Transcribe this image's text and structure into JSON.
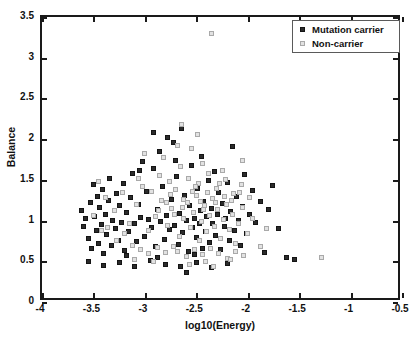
{
  "chart_data": {
    "type": "scatter",
    "title": "",
    "xlabel": "log10(Energy)",
    "ylabel": "Balance",
    "xlim": [
      -4,
      -0.5
    ],
    "ylim": [
      0,
      3.5
    ],
    "xticks": [
      -4,
      -3.5,
      -3,
      -2.5,
      -2,
      -1.5,
      -1,
      -0.5
    ],
    "xticklabels": [
      "-4",
      "-3.5",
      "-3",
      "-2.5",
      "-2",
      "-1.5",
      "-1",
      "-0.5"
    ],
    "yticks": [
      0,
      0.5,
      1,
      1.5,
      2,
      2.5,
      3,
      3.5
    ],
    "yticklabels": [
      "0",
      "0.5",
      "1",
      "1.5",
      "2",
      "2.5",
      "3",
      "3.5"
    ],
    "grid": false,
    "legend_position": "top-right",
    "colors": {
      "carrier": "#2b2b2b",
      "noncarrier": "#e2e2e2",
      "noncarrier_edge": "#a9a9a9",
      "axis": "#1a1a1a"
    },
    "series": [
      {
        "name": "Mutation carrier",
        "marker": "filled-square",
        "color": "#2b2b2b",
        "points": [
          [
            -3.62,
            1.12
          ],
          [
            -3.6,
            0.93
          ],
          [
            -3.58,
            1.02
          ],
          [
            -3.55,
            0.78
          ],
          [
            -3.53,
            1.22
          ],
          [
            -3.52,
            0.66
          ],
          [
            -3.5,
            1.44
          ],
          [
            -3.49,
            1.05
          ],
          [
            -3.47,
            0.88
          ],
          [
            -3.46,
            1.3
          ],
          [
            -3.45,
            0.72
          ],
          [
            -3.44,
            1.16
          ],
          [
            -3.42,
            0.95
          ],
          [
            -3.41,
            1.38
          ],
          [
            -3.4,
            0.6
          ],
          [
            -3.38,
            1.08
          ],
          [
            -3.37,
            0.83
          ],
          [
            -3.35,
            1.25
          ],
          [
            -3.34,
            1.52
          ],
          [
            -3.32,
            0.7
          ],
          [
            -3.31,
            1.0
          ],
          [
            -3.29,
            0.9
          ],
          [
            -3.28,
            1.33
          ],
          [
            -3.26,
            0.75
          ],
          [
            -3.25,
            1.18
          ],
          [
            -3.23,
            0.98
          ],
          [
            -3.21,
            1.46
          ],
          [
            -3.2,
            0.63
          ],
          [
            -3.18,
            1.1
          ],
          [
            -3.16,
            0.86
          ],
          [
            -3.14,
            1.28
          ],
          [
            -3.12,
            1.58
          ],
          [
            -3.1,
            0.96
          ],
          [
            -3.08,
            0.74
          ],
          [
            -3.06,
            1.2
          ],
          [
            -3.04,
            1.04
          ],
          [
            -3.02,
            1.73
          ],
          [
            -3.0,
            0.8
          ],
          [
            -2.98,
            1.36
          ],
          [
            -2.96,
            1.01
          ],
          [
            -2.94,
            0.92
          ],
          [
            -2.92,
            1.64
          ],
          [
            -2.9,
            0.68
          ],
          [
            -2.88,
            1.14
          ],
          [
            -2.86,
            1.85
          ],
          [
            -2.85,
            0.99
          ],
          [
            -2.83,
            1.42
          ],
          [
            -2.81,
            0.77
          ],
          [
            -2.79,
            1.06
          ],
          [
            -2.78,
            2.02
          ],
          [
            -2.76,
            0.89
          ],
          [
            -2.74,
            1.26
          ],
          [
            -2.72,
            1.96
          ],
          [
            -2.71,
            0.94
          ],
          [
            -2.69,
            1.54
          ],
          [
            -2.67,
            0.71
          ],
          [
            -2.66,
            1.09
          ],
          [
            -2.64,
            2.13
          ],
          [
            -2.63,
            0.85
          ],
          [
            -2.61,
            1.31
          ],
          [
            -2.6,
            1.0
          ],
          [
            -2.58,
            0.62
          ],
          [
            -2.57,
            1.18
          ],
          [
            -2.55,
            1.68
          ],
          [
            -2.54,
            0.91
          ],
          [
            -2.52,
            1.03
          ],
          [
            -2.5,
            0.79
          ],
          [
            -2.49,
            1.4
          ],
          [
            -2.47,
            0.97
          ],
          [
            -2.46,
            1.12
          ],
          [
            -2.44,
            0.66
          ],
          [
            -2.43,
            1.23
          ],
          [
            -2.41,
            0.87
          ],
          [
            -2.4,
            1.05
          ],
          [
            -2.38,
            1.49
          ],
          [
            -2.37,
            0.73
          ],
          [
            -2.35,
            1.15
          ],
          [
            -2.34,
            0.96
          ],
          [
            -2.32,
            1.6
          ],
          [
            -2.31,
            0.82
          ],
          [
            -2.29,
            1.07
          ],
          [
            -2.28,
            1.34
          ],
          [
            -2.26,
            0.64
          ],
          [
            -2.25,
            1.21
          ],
          [
            -2.23,
            0.93
          ],
          [
            -2.22,
            1.02
          ],
          [
            -2.2,
            1.47
          ],
          [
            -2.18,
            0.76
          ],
          [
            -2.17,
            1.11
          ],
          [
            -2.15,
            1.91
          ],
          [
            -2.13,
            0.88
          ],
          [
            -2.11,
            1.29
          ],
          [
            -2.09,
            1.0
          ],
          [
            -2.07,
            0.69
          ],
          [
            -2.05,
            1.17
          ],
          [
            -2.03,
            1.56
          ],
          [
            -2.01,
            0.84
          ],
          [
            -1.98,
            1.08
          ],
          [
            -1.95,
            1.37
          ],
          [
            -1.92,
            0.98
          ],
          [
            -1.88,
            1.24
          ],
          [
            -1.84,
            0.61
          ],
          [
            -1.8,
            1.13
          ],
          [
            -1.76,
            1.43
          ],
          [
            -1.7,
            0.9
          ],
          [
            -1.62,
            0.55
          ],
          [
            -1.55,
            0.52
          ],
          [
            -3.55,
            0.5
          ],
          [
            -3.4,
            0.45
          ],
          [
            -3.25,
            0.48
          ],
          [
            -3.1,
            0.44
          ],
          [
            -2.95,
            0.51
          ],
          [
            -2.8,
            0.46
          ],
          [
            -2.65,
            0.43
          ],
          [
            -2.5,
            0.49
          ],
          [
            -2.35,
            0.42
          ],
          [
            -2.2,
            0.47
          ],
          [
            -2.6,
            0.36
          ],
          [
            -2.45,
            1.79
          ],
          [
            -2.92,
            2.08
          ],
          [
            -2.7,
            1.74
          ],
          [
            -3.05,
            1.62
          ],
          [
            -2.88,
            0.55
          ],
          [
            -2.52,
            0.58
          ],
          [
            -3.18,
            0.57
          ]
        ]
      },
      {
        "name": "Non-carrier",
        "marker": "open-square",
        "color": "#e2e2e2",
        "points": [
          [
            -2.35,
            3.3
          ],
          [
            -2.64,
            2.18
          ],
          [
            -3.0,
            1.82
          ],
          [
            -2.82,
            1.78
          ],
          [
            -2.55,
            1.88
          ],
          [
            -3.45,
            1.48
          ],
          [
            -3.38,
            1.28
          ],
          [
            -3.3,
            1.12
          ],
          [
            -3.22,
            1.35
          ],
          [
            -3.15,
            0.97
          ],
          [
            -3.08,
            1.2
          ],
          [
            -3.02,
            1.42
          ],
          [
            -2.96,
            0.88
          ],
          [
            -2.9,
            1.05
          ],
          [
            -2.84,
            1.25
          ],
          [
            -2.78,
            0.94
          ],
          [
            -2.74,
            1.15
          ],
          [
            -2.7,
            1.38
          ],
          [
            -2.66,
            0.8
          ],
          [
            -2.62,
            1.02
          ],
          [
            -2.59,
            1.22
          ],
          [
            -2.56,
            0.91
          ],
          [
            -2.53,
            1.1
          ],
          [
            -2.5,
            1.31
          ],
          [
            -2.47,
            0.75
          ],
          [
            -2.45,
            0.99
          ],
          [
            -2.42,
            1.18
          ],
          [
            -2.4,
            0.86
          ],
          [
            -2.37,
            1.06
          ],
          [
            -2.34,
            1.27
          ],
          [
            -2.32,
            0.93
          ],
          [
            -2.29,
            1.13
          ],
          [
            -2.26,
            0.78
          ],
          [
            -2.24,
            1.01
          ],
          [
            -2.21,
            1.2
          ],
          [
            -2.18,
            0.89
          ],
          [
            -2.15,
            1.08
          ],
          [
            -2.12,
            0.72
          ],
          [
            -2.09,
            0.96
          ],
          [
            -2.05,
            1.16
          ],
          [
            -2.0,
            0.84
          ],
          [
            -1.95,
            1.03
          ],
          [
            -1.88,
            0.68
          ],
          [
            -1.82,
            0.9
          ],
          [
            -1.28,
            0.55
          ],
          [
            -2.68,
            0.62
          ],
          [
            -2.6,
            0.56
          ],
          [
            -2.52,
            0.64
          ],
          [
            -2.44,
            0.58
          ],
          [
            -2.36,
            0.66
          ],
          [
            -2.28,
            0.6
          ],
          [
            -2.2,
            0.54
          ],
          [
            -2.12,
            0.62
          ],
          [
            -2.04,
            0.57
          ],
          [
            -2.72,
            0.68
          ],
          [
            -2.8,
            0.61
          ],
          [
            -2.88,
            0.67
          ],
          [
            -2.96,
            0.59
          ],
          [
            -3.04,
            0.65
          ],
          [
            -3.12,
            0.7
          ],
          [
            -3.2,
            0.84
          ],
          [
            -3.28,
            0.76
          ],
          [
            -3.36,
            0.92
          ],
          [
            -2.58,
            1.52
          ],
          [
            -2.48,
            1.45
          ],
          [
            -2.38,
            1.58
          ],
          [
            -2.3,
            1.4
          ],
          [
            -2.22,
            1.51
          ],
          [
            -2.14,
            1.33
          ],
          [
            -2.06,
            1.44
          ],
          [
            -2.76,
            1.48
          ],
          [
            -2.86,
            1.55
          ],
          [
            -2.94,
            1.36
          ],
          [
            -3.06,
            1.52
          ],
          [
            -2.65,
            1.66
          ],
          [
            -2.44,
            1.7
          ],
          [
            -2.25,
            1.62
          ],
          [
            -2.05,
            1.74
          ],
          [
            -1.98,
            1.28
          ],
          [
            -3.5,
            1.06
          ],
          [
            -3.42,
            0.88
          ],
          [
            -2.68,
            1.92
          ],
          [
            -2.49,
            2.06
          ],
          [
            -2.57,
            0.46
          ],
          [
            -2.41,
            0.5
          ],
          [
            -2.33,
            0.44
          ],
          [
            -2.17,
            0.52
          ],
          [
            -2.92,
            0.5
          ],
          [
            -3.1,
            0.52
          ],
          [
            -2.75,
            1.32
          ],
          [
            -2.62,
            1.26
          ],
          [
            -2.54,
            1.36
          ],
          [
            -2.46,
            1.24
          ],
          [
            -2.39,
            1.34
          ],
          [
            -2.31,
            1.22
          ],
          [
            -2.23,
            1.3
          ],
          [
            -2.16,
            1.25
          ],
          [
            -2.08,
            1.35
          ],
          [
            -2.87,
            1.12
          ],
          [
            -2.79,
            1.22
          ],
          [
            -2.71,
            1.08
          ],
          [
            -2.63,
            1.16
          ],
          [
            -2.51,
            1.42
          ],
          [
            -2.43,
            1.13
          ],
          [
            -2.27,
            1.46
          ]
        ]
      }
    ]
  },
  "legend": {
    "items": [
      {
        "label": "Mutation carrier",
        "marker_class": "carrier"
      },
      {
        "label": "Non-carrier",
        "marker_class": "noncarrier"
      }
    ]
  }
}
